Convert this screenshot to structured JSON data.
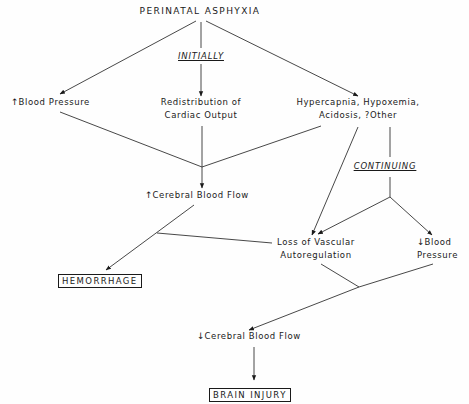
{
  "diagram": {
    "title": "PERINATAL ASPHYXIA",
    "phase_labels": {
      "initially": "INITIALLY",
      "continuing": "CONTINUING"
    },
    "nodes": {
      "bp_up": {
        "arrow": "↑",
        "label": "Blood Pressure"
      },
      "redistribution": {
        "line1": "Redistribution of",
        "line2": "Cardiac Output"
      },
      "hypercapnia": {
        "line1": "Hypercapnia, Hypoxemia,",
        "line2": "Acidosis, ?Other"
      },
      "cbf_up": {
        "arrow": "↑",
        "label": "Cerebral Blood Flow"
      },
      "loss_autoreg": {
        "line1": "Loss of Vascular",
        "line2": "Autoregulation"
      },
      "bp_down": {
        "arrow": "↓",
        "line1": "Blood",
        "line2": "Pressure"
      },
      "hemorrhage": {
        "label": "HEMORRHAGE"
      },
      "cbf_down": {
        "arrow": "↓",
        "label": "Cerebral Blood Flow"
      },
      "brain_injury": {
        "label": "BRAIN INJURY"
      }
    },
    "colors": {
      "ink": "#1a1a1a",
      "background": "#fefefe"
    }
  }
}
